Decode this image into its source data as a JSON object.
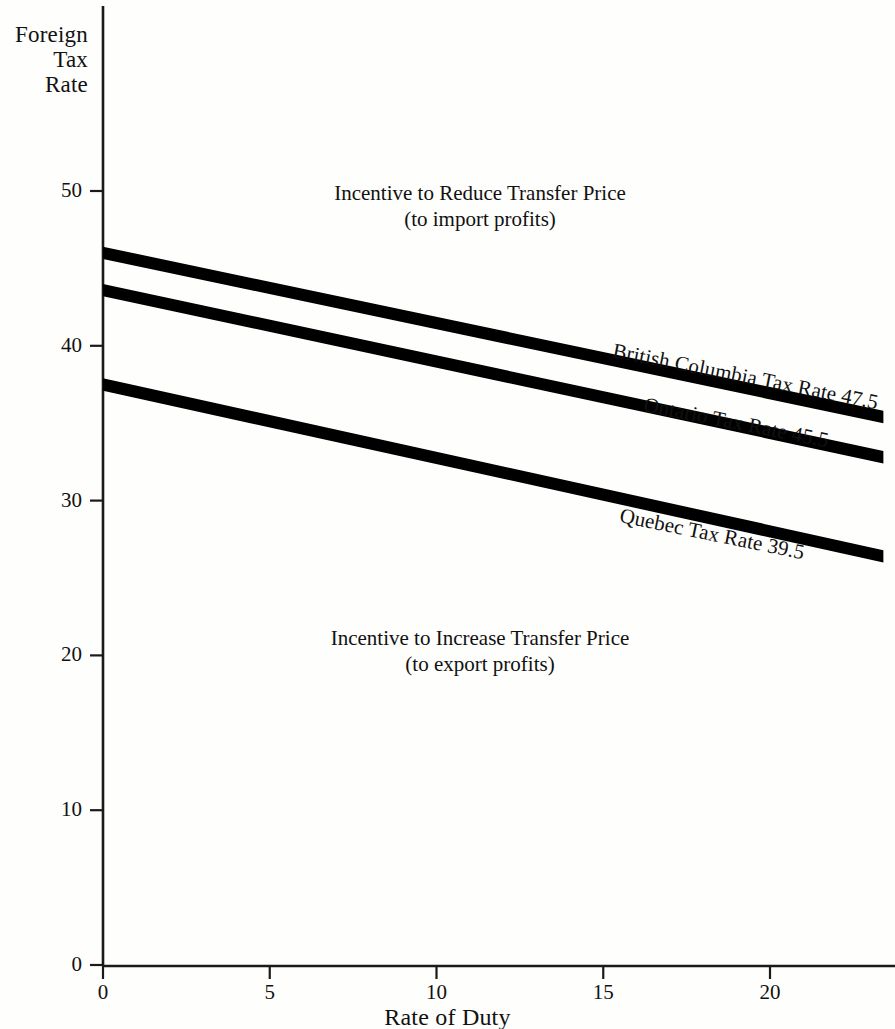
{
  "chart_data": {
    "type": "line",
    "title": "",
    "xlabel": "Rate of Duty",
    "ylabel": "Foreign\nTax\nRate",
    "xlim": [
      0,
      23.4
    ],
    "ylim": [
      0,
      54
    ],
    "xticks": [
      0,
      5,
      10,
      15,
      20
    ],
    "xticklabels": [
      "0",
      "5",
      "10",
      "15",
      "20"
    ],
    "yticks": [
      0,
      10,
      20,
      30,
      40,
      50
    ],
    "yticklabels": [
      "0",
      "10",
      "20",
      "30",
      "40",
      "50"
    ],
    "grid": false,
    "legend_position": "inline-along-lines",
    "x": [
      0,
      23.4
    ],
    "series": [
      {
        "name": "British Columbia Tax Rate 47.5",
        "label": "British Columbia Tax Rate 47.5",
        "values": [
          46.0,
          35.4
        ],
        "band_thickness": 0.8,
        "color": "#000000"
      },
      {
        "name": "Ontario Tax Rate 45.5",
        "label": "Ontario Tax Rate 45.5",
        "values": [
          43.6,
          32.8
        ],
        "band_thickness": 0.8,
        "color": "#000000"
      },
      {
        "name": "Quebec Tax Rate 39.5",
        "label": "Quebec Tax Rate 39.5",
        "values": [
          37.5,
          26.4
        ],
        "band_thickness": 0.8,
        "color": "#000000"
      }
    ],
    "annotations": [
      {
        "id": "upper-region",
        "line1": "Incentive to Reduce Transfer Price",
        "line2": "(to import profits)",
        "x": 11.3,
        "y": 49.0
      },
      {
        "id": "lower-region",
        "line1": "Incentive to Increase Transfer Price",
        "line2": "(to export profits)",
        "x": 11.3,
        "y": 21.1
      }
    ]
  },
  "axes": {
    "y_title": "Foreign\nTax\nRate",
    "x_title": "Rate of Duty"
  },
  "ticks": {
    "y": [
      {
        "value": 50,
        "label": "50",
        "px": 191
      },
      {
        "value": 40,
        "label": "40",
        "px": 350
      },
      {
        "value": 30,
        "label": "30",
        "px": 508
      },
      {
        "value": 20,
        "label": "20",
        "px": 666
      },
      {
        "value": 10,
        "label": "10",
        "px": 824
      },
      {
        "value": 0,
        "label": "0",
        "px": 965
      }
    ],
    "x": [
      {
        "value": 0,
        "label": "0",
        "px": 103
      },
      {
        "value": 5,
        "label": "5",
        "px": 270
      },
      {
        "value": 10,
        "label": "10",
        "px": 437
      },
      {
        "value": 15,
        "label": "15",
        "px": 603
      },
      {
        "value": 20,
        "label": "20",
        "px": 770
      }
    ]
  },
  "annotations": {
    "upper": {
      "line1": "Incentive to Reduce Transfer Price",
      "line2": "(to import profits)"
    },
    "lower": {
      "line1": "Incentive to Increase Transfer Price",
      "line2": "(to export profits)"
    }
  },
  "series_labels": {
    "bc": "British Columbia Tax Rate 47.5",
    "ontario": "Ontario Tax Rate 45.5",
    "quebec": "Quebec Tax Rate 39.5"
  },
  "colors": {
    "ink": "#000000",
    "paper": "#fefefc",
    "axis": "#1a1a1a"
  }
}
